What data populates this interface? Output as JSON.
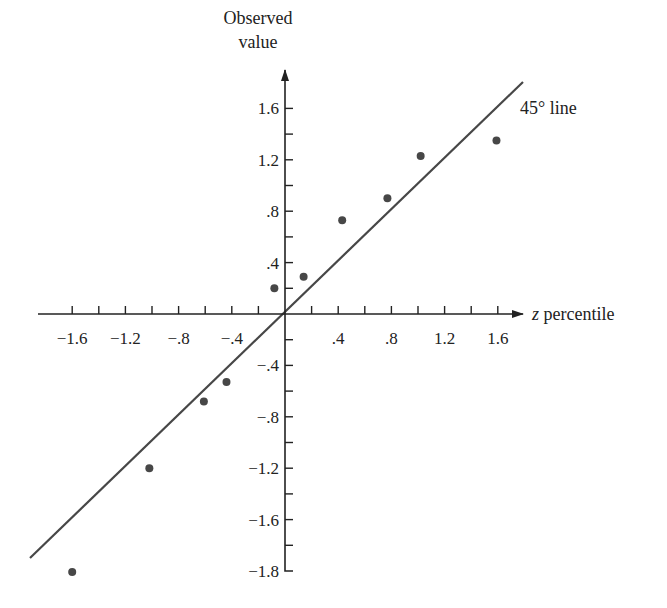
{
  "chart_data": {
    "type": "scatter",
    "title": "",
    "xlabel": "z percentile",
    "ylabel": "Observed value",
    "xlim": [
      -1.8,
      1.8
    ],
    "ylim": [
      -2.0,
      1.8
    ],
    "grid": false,
    "legend": null,
    "x_tick_labels": [
      "-1.6",
      "-1.2",
      "-.8",
      "-.4",
      ".4",
      ".8",
      "1.2",
      "1.6"
    ],
    "x_tick_values": [
      -1.6,
      -1.2,
      -0.8,
      -0.4,
      0.4,
      0.8,
      1.2,
      1.6
    ],
    "y_tick_labels": [
      "1.6",
      "1.2",
      ".8",
      ".4",
      "-.4",
      "-.8",
      "-1.2",
      "-1.6",
      "-1.8"
    ],
    "y_tick_values": [
      1.6,
      1.2,
      0.8,
      0.4,
      -0.4,
      -0.8,
      -1.2,
      -1.6,
      -2.0
    ],
    "series": [
      {
        "name": "observations",
        "points": [
          {
            "x": -1.6,
            "y": -1.8
          },
          {
            "x": -1.02,
            "y": -1.2
          },
          {
            "x": -0.61,
            "y": -0.68
          },
          {
            "x": -0.44,
            "y": -0.53
          },
          {
            "x": -0.08,
            "y": 0.2
          },
          {
            "x": 0.14,
            "y": 0.29
          },
          {
            "x": 0.43,
            "y": 0.73
          },
          {
            "x": 0.77,
            "y": 0.9
          },
          {
            "x": 1.02,
            "y": 1.23
          },
          {
            "x": 1.59,
            "y": 1.35
          }
        ]
      }
    ],
    "reference_line": {
      "label": "45° line",
      "slope": 1,
      "intercept": 0
    },
    "annotations": [
      "45° line"
    ]
  },
  "labels": {
    "y_axis_title_line1": "Observed",
    "y_axis_title_line2": "value",
    "x_axis_title_italic": "z",
    "x_axis_title_rest": " percentile",
    "reference_line_label": "45° line"
  },
  "colors": {
    "axis": "#222222",
    "points": "#474747",
    "reference_line": "#474747",
    "text": "#222222"
  }
}
